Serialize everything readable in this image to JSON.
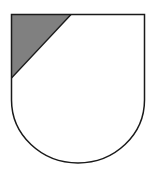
{
  "figure": {
    "type": "heraldic-shield",
    "division": "canton-bendwise-sinister",
    "colors": {
      "background": "#ffffff",
      "field": "#ffffff",
      "canton": "#808080",
      "outline": "#1a1a1a"
    }
  }
}
